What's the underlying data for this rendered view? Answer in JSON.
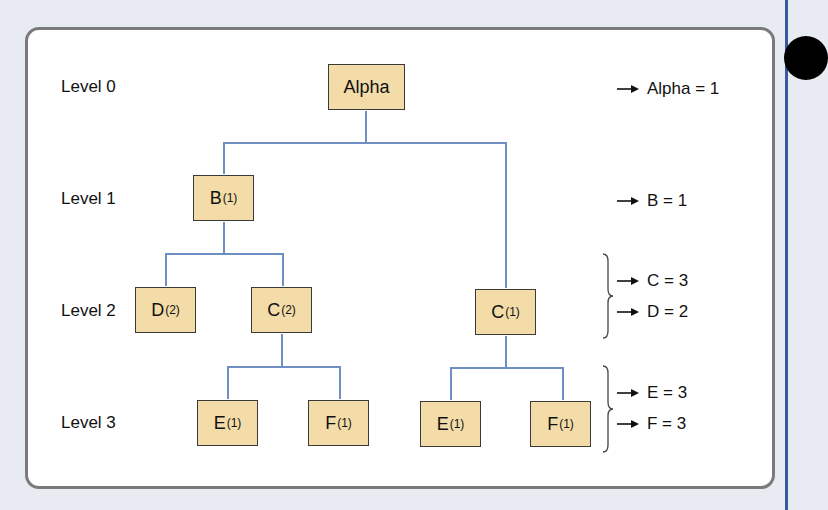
{
  "levels": [
    {
      "label": "Level 0"
    },
    {
      "label": "Level 1"
    },
    {
      "label": "Level 2"
    },
    {
      "label": "Level 3"
    }
  ],
  "nodes": {
    "alpha": {
      "name": "Alpha",
      "count": ""
    },
    "b": {
      "name": "B",
      "count": "(1)"
    },
    "d": {
      "name": "D",
      "count": "(2)"
    },
    "c_left": {
      "name": "C",
      "count": "(2)"
    },
    "c_right": {
      "name": "C",
      "count": "(1)"
    },
    "e_left": {
      "name": "E",
      "count": "(1)"
    },
    "f_left": {
      "name": "F",
      "count": "(1)"
    },
    "e_right": {
      "name": "E",
      "count": "(1)"
    },
    "f_right": {
      "name": "F",
      "count": "(1)"
    }
  },
  "results": [
    {
      "text": "Alpha = 1"
    },
    {
      "text": "B = 1"
    },
    {
      "text": "C = 3"
    },
    {
      "text": "D = 2"
    },
    {
      "text": "E = 3"
    },
    {
      "text": "F = 3"
    }
  ],
  "colors": {
    "node_fill": "#f3dca8",
    "connector": "#6f8fc4",
    "panel_border": "#7a7a7a",
    "background": "#e8ebf1",
    "edge_line": "#3a58a0"
  }
}
